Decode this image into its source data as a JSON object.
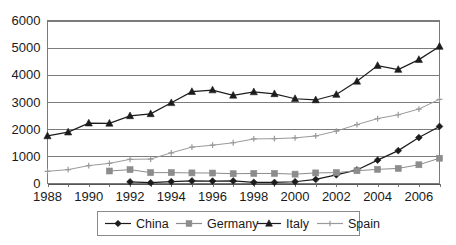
{
  "chart_data": {
    "type": "line",
    "title": "",
    "subtitle": "",
    "xlabel": "",
    "ylabel": "",
    "xlim": [
      1988,
      2007
    ],
    "ylim": [
      0,
      6000
    ],
    "grid": true,
    "legend_position": "bottom",
    "y_ticks": [
      0,
      1000,
      2000,
      3000,
      4000,
      5000,
      6000
    ],
    "y_tick_labels": [
      "0",
      "1000",
      "2000",
      "3000",
      "4000",
      "5000",
      "6000"
    ],
    "x": [
      1988,
      1989,
      1990,
      1991,
      1992,
      1993,
      1994,
      1995,
      1996,
      1997,
      1998,
      1999,
      2000,
      2001,
      2002,
      2003,
      2004,
      2005,
      2006,
      2007
    ],
    "x_tick_values": [
      1988,
      1990,
      1992,
      1994,
      1996,
      1998,
      2000,
      2002,
      2004,
      2006
    ],
    "x_tick_labels": [
      "1988",
      "1990",
      "1992",
      "1994",
      "1996",
      "1998",
      "2000",
      "2002",
      "2004",
      "2006"
    ],
    "series": [
      {
        "name": "China",
        "marker": "diamond",
        "color": "#1c1c1c",
        "values": [
          null,
          null,
          null,
          null,
          60,
          30,
          70,
          95,
          90,
          95,
          45,
          40,
          65,
          150,
          320,
          500,
          860,
          1210,
          1690,
          2100
        ]
      },
      {
        "name": "Germany",
        "marker": "square",
        "color": "#8c8c8c",
        "values": [
          null,
          null,
          null,
          460,
          510,
          400,
          400,
          390,
          385,
          360,
          370,
          370,
          345,
          390,
          400,
          470,
          520,
          555,
          690,
          930
        ]
      },
      {
        "name": "Italy",
        "marker": "triangle",
        "color": "#1c1c1c",
        "values": [
          1750,
          1890,
          2220,
          2215,
          2490,
          2565,
          2970,
          3380,
          3440,
          3245,
          3370,
          3300,
          3120,
          3075,
          3275,
          3760,
          4340,
          4195,
          4560,
          5045
        ]
      },
      {
        "name": "Spain",
        "marker": "plus",
        "color": "#9a9a9a",
        "values": [
          450,
          510,
          660,
          740,
          890,
          900,
          1130,
          1340,
          1410,
          1500,
          1640,
          1650,
          1680,
          1750,
          1930,
          2170,
          2390,
          2530,
          2740,
          3100
        ]
      }
    ]
  },
  "legend": {
    "items": [
      {
        "label": "China"
      },
      {
        "label": "Germany"
      },
      {
        "label": "Italy"
      },
      {
        "label": "Spain"
      }
    ]
  }
}
